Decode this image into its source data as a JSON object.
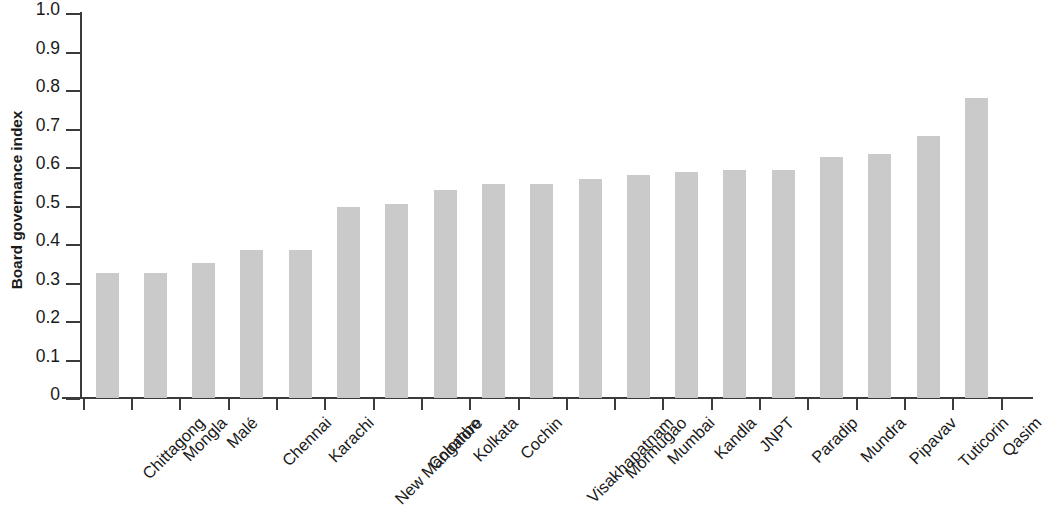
{
  "chart_data": {
    "type": "bar",
    "title": "",
    "xlabel": "",
    "ylabel": "Board governance index",
    "ylim": [
      0,
      1.0
    ],
    "grid": false,
    "legend": null,
    "orientation": "vertical",
    "bar_color": "#c2c2c2",
    "axis_color": "#3b3b3b",
    "y_ticks": [
      "1.0",
      "0.9",
      "0.8",
      "0.7",
      "0.6",
      "0.5",
      "0.4",
      "0.3",
      "0.2",
      "0.1",
      "0"
    ],
    "y_tick_values": [
      1.0,
      0.9,
      0.8,
      0.7,
      0.6,
      0.5,
      0.4,
      0.3,
      0.2,
      0.1,
      0
    ],
    "categories": [
      "Chittagong",
      "Mongla",
      "Malé",
      "Chennai",
      "Karachi",
      "New Mangalore",
      "Colombo",
      "Kolkata",
      "Cochin",
      "Visakhapatnam",
      "Mormugao",
      "Mumbai",
      "Kandla",
      "JNPT",
      "Paradip",
      "Mundra",
      "Pipavav",
      "Tuticorin",
      "Qasim"
    ],
    "values": [
      0.325,
      0.325,
      0.35,
      0.385,
      0.385,
      0.497,
      0.503,
      0.54,
      0.557,
      0.557,
      0.57,
      0.578,
      0.588,
      0.592,
      0.592,
      0.625,
      0.633,
      0.68,
      0.78
    ]
  }
}
